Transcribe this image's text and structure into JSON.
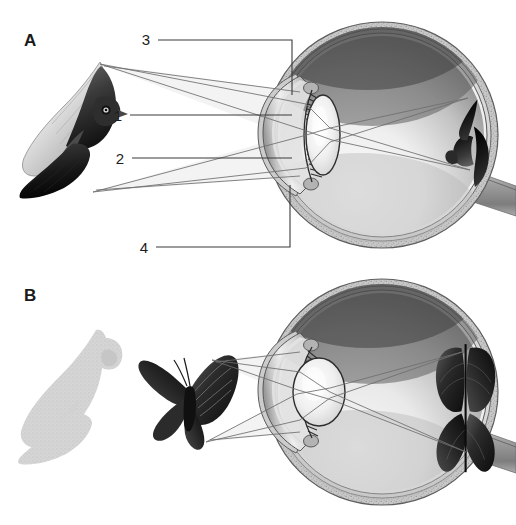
{
  "figure": {
    "background_color": "#ffffff",
    "width": 516,
    "height": 525
  },
  "panels": [
    {
      "id": "A",
      "letter": "A",
      "letter_position": {
        "x": 24,
        "y": 46
      },
      "description": "Distant object (flying bird) focused on the retina; lens flattened.",
      "object": {
        "name": "bird-illustration",
        "label": "flying bird",
        "position": {
          "x": 12,
          "y": 55,
          "w": 108,
          "h": 150
        }
      },
      "retinal_image": {
        "name": "retinal-image-bird",
        "label": "inverted bird image on retina",
        "position": {
          "x": 448,
          "y": 85,
          "w": 46,
          "h": 110
        }
      },
      "eye": {
        "name": "eye-cross-section",
        "center": {
          "x": 382,
          "y": 135
        },
        "radius_x": 116,
        "radius_y": 113,
        "parts": [
          "sclera",
          "choroid",
          "retina",
          "cornea",
          "lens",
          "iris",
          "ciliary-body",
          "zonule-fibers",
          "optic-nerve",
          "vitreous-humor"
        ]
      },
      "callouts": [
        {
          "number": "3",
          "text_x": 146,
          "text_y": 45,
          "line_from_x": 158,
          "line_y": 40,
          "elbow_x": 292,
          "elbow_to_y": 95,
          "target": "cornea"
        },
        {
          "number": "1",
          "text_x": 118,
          "text_y": 121,
          "line_from_x": 130,
          "line_y": 115,
          "elbow_x": 292,
          "elbow_to_y": 115,
          "target": "aqueous-humor"
        },
        {
          "number": "2",
          "text_x": 120,
          "text_y": 164,
          "line_from_x": 132,
          "line_y": 158,
          "elbow_x": 292,
          "elbow_to_y": 158,
          "target": "lens"
        },
        {
          "number": "4",
          "text_x": 144,
          "text_y": 253,
          "line_from_x": 156,
          "line_y": 247,
          "elbow_x": 290,
          "elbow_to_y": 185,
          "target": "iris"
        }
      ]
    },
    {
      "id": "B",
      "letter": "B",
      "letter_position": {
        "x": 24,
        "y": 301
      },
      "description": "Near object (butterfly) focused on the retina; lens rounded. Faded bird shown for scale comparison.",
      "object": {
        "name": "butterfly-illustration",
        "label": "butterfly",
        "position": {
          "x": 140,
          "y": 352,
          "w": 96,
          "h": 84
        }
      },
      "ghost_object": {
        "name": "bird-silhouette-faded",
        "label": "faded bird silhouette",
        "position": {
          "x": 18,
          "y": 322,
          "w": 104,
          "h": 138
        }
      },
      "retinal_image": {
        "name": "retinal-image-butterfly",
        "label": "inverted butterfly image on retina",
        "position": {
          "x": 430,
          "y": 340,
          "w": 60,
          "h": 128
        }
      },
      "eye": {
        "name": "eye-cross-section",
        "center": {
          "x": 382,
          "y": 392
        },
        "radius_x": 116,
        "radius_y": 113,
        "parts": [
          "sclera",
          "choroid",
          "retina",
          "cornea",
          "lens",
          "iris",
          "ciliary-body",
          "zonule-fibers",
          "optic-nerve",
          "vitreous-humor"
        ]
      },
      "callouts": []
    }
  ],
  "legend_numbers": [
    "1",
    "2",
    "3",
    "4"
  ],
  "colors": {
    "ink": "#1a1a1a",
    "leader": "#3a3a3a",
    "ray": "#6e6e6e",
    "sclera_outer": "#8e8e8e",
    "sclera_speckle": "#c9c9c9",
    "vitreous_light": "#f2f2f2",
    "vitreous_dark": "#4d4d4d",
    "cornea": "#cfcfcf",
    "lens": "#efefef",
    "ghost": "#cdcdcd",
    "background": "#ffffff"
  }
}
